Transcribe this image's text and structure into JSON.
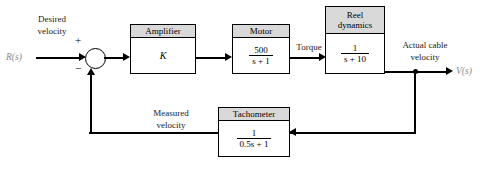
{
  "diagram": {
    "signals": {
      "input": "R(s)",
      "output": "V(s)"
    },
    "labels": {
      "desired_velocity_line1": "Desired",
      "desired_velocity_line2": "velocity",
      "torque": "Torque",
      "actual_cable_line1": "Actual cable",
      "actual_cable_line2": "velocity",
      "measured_line1": "Measured",
      "measured_line2": "velocity",
      "plus_sign": "+",
      "minus_sign": "−"
    },
    "blocks": [
      {
        "name": "amplifier",
        "header": "Amplifier",
        "gain": "K"
      },
      {
        "name": "motor",
        "header": "Motor",
        "numerator": "500",
        "denominator": "s + 1"
      },
      {
        "name": "reel-dynamics",
        "header_line1": "Reel",
        "header_line2": "dynamics",
        "numerator": "1",
        "denominator": "s + 10"
      },
      {
        "name": "tachometer",
        "header": "Tachometer",
        "numerator": "1",
        "denominator": "0.5s + 1"
      }
    ],
    "colors": {
      "header_fill": "#d9d9d9",
      "line": "#000000",
      "signal_text": "#8a8a8a"
    }
  }
}
